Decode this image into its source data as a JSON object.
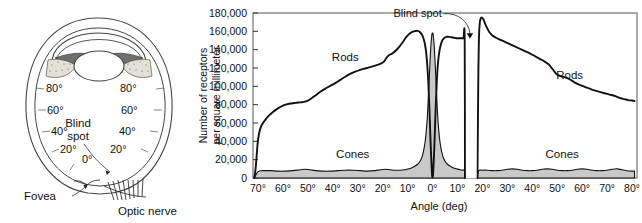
{
  "figure": {
    "left_panel": {
      "name": "eye-cross-section-diagram",
      "labels": {
        "blind_spot_line1": "Blind",
        "blind_spot_line2": "spot",
        "fovea": "Fovea",
        "optic_nerve": "Optic nerve"
      },
      "angle_ticks_left": [
        "80°",
        "60°",
        "40°",
        "20°"
      ],
      "angle_ticks_right": [
        "80°",
        "60°",
        "40°",
        "20°"
      ],
      "center_tick": "0°",
      "near_blindspot_tick": "20°"
    }
  },
  "chart_data": {
    "type": "line",
    "title": "",
    "xlabel": "Angle (deg)",
    "ylabel": "Number of receptors per square millimeter",
    "ylabel_line1": "Number of receptors",
    "ylabel_line2": "per square millimeter",
    "ylim": [
      0,
      180000
    ],
    "ytick_labels": [
      "0",
      "20,000",
      "40,000",
      "60,000",
      "80,000",
      "100,000",
      "120,000",
      "140,000",
      "160,000",
      "180,000"
    ],
    "ytick_values": [
      0,
      20000,
      40000,
      60000,
      80000,
      100000,
      120000,
      140000,
      160000,
      180000
    ],
    "xtick_labels": [
      "70°",
      "60°",
      "50°",
      "40°",
      "30°",
      "20°",
      "10°",
      "0°",
      "10°",
      "20°",
      "30°",
      "40°",
      "50°",
      "60°",
      "70°",
      "80°"
    ],
    "xtick_values": [
      -70,
      -60,
      -50,
      -40,
      -30,
      -20,
      -10,
      0,
      10,
      20,
      30,
      40,
      50,
      60,
      70,
      80
    ],
    "xlim": [
      -72,
      82
    ],
    "grid": false,
    "legend_position": "inline-annotations",
    "annotations": [
      {
        "text": "Blind spot",
        "target_x": 15,
        "target_y": 152000
      },
      {
        "text": "Rods",
        "x": -35,
        "y": 128000
      },
      {
        "text": "Rods",
        "x": 55,
        "y": 108000
      },
      {
        "text": "Cones",
        "x": -32,
        "y": 22000
      },
      {
        "text": "Cones",
        "x": 52,
        "y": 22000
      }
    ],
    "blind_spot_gap": {
      "from_deg": 13.0,
      "to_deg": 18.0,
      "label": "Blind spot"
    },
    "series": [
      {
        "name": "Rods",
        "fill": "none",
        "stroke": "#111111",
        "points": [
          [
            -71.5,
            0
          ],
          [
            -71.0,
            9000
          ],
          [
            -70.6,
            22000
          ],
          [
            -70.2,
            36000
          ],
          [
            -69.6,
            48000
          ],
          [
            -68.8,
            56000
          ],
          [
            -67.5,
            62000
          ],
          [
            -66.0,
            67000
          ],
          [
            -64.0,
            72000
          ],
          [
            -62.0,
            76000
          ],
          [
            -60.0,
            79000
          ],
          [
            -57.5,
            81000
          ],
          [
            -55.0,
            82000
          ],
          [
            -53.0,
            82500
          ],
          [
            -51.5,
            83000
          ],
          [
            -50.0,
            84500
          ],
          [
            -48.5,
            87000
          ],
          [
            -47.0,
            90000
          ],
          [
            -45.0,
            94000
          ],
          [
            -43.0,
            97500
          ],
          [
            -41.0,
            100500
          ],
          [
            -39.0,
            103500
          ],
          [
            -37.0,
            107000
          ],
          [
            -35.0,
            110500
          ],
          [
            -33.0,
            113500
          ],
          [
            -31.0,
            116000
          ],
          [
            -29.0,
            118000
          ],
          [
            -27.0,
            119500
          ],
          [
            -25.0,
            121000
          ],
          [
            -23.0,
            122500
          ],
          [
            -21.0,
            124500
          ],
          [
            -19.5,
            127000
          ],
          [
            -18.5,
            131000
          ],
          [
            -17.5,
            134000
          ],
          [
            -16.0,
            136000
          ],
          [
            -14.0,
            141000
          ],
          [
            -12.0,
            148000
          ],
          [
            -10.5,
            154000
          ],
          [
            -9.0,
            158000
          ],
          [
            -7.5,
            160000
          ],
          [
            -6.0,
            160500
          ],
          [
            -5.0,
            159000
          ],
          [
            -4.0,
            155000
          ],
          [
            -3.2,
            148000
          ],
          [
            -2.6,
            138000
          ],
          [
            -2.2,
            126000
          ],
          [
            -1.8,
            110000
          ],
          [
            -1.5,
            92000
          ],
          [
            -1.2,
            72000
          ],
          [
            -1.0,
            56000
          ],
          [
            -0.8,
            40000
          ],
          [
            -0.6,
            26000
          ],
          [
            -0.4,
            14000
          ],
          [
            -0.25,
            6000
          ],
          [
            -0.15,
            2000
          ],
          [
            0.0,
            0
          ],
          [
            0.15,
            2000
          ],
          [
            0.25,
            6000
          ],
          [
            0.4,
            14000
          ],
          [
            0.6,
            26000
          ],
          [
            0.8,
            40000
          ],
          [
            1.0,
            56000
          ],
          [
            1.2,
            72000
          ],
          [
            1.5,
            92000
          ],
          [
            1.8,
            110000
          ],
          [
            2.2,
            126000
          ],
          [
            2.8,
            139000
          ],
          [
            3.6,
            148000
          ],
          [
            4.6,
            152500
          ],
          [
            5.6,
            154000
          ],
          [
            6.6,
            154000
          ],
          [
            7.6,
            153500
          ],
          [
            8.6,
            153000
          ],
          [
            9.6,
            152500
          ],
          [
            10.6,
            152500
          ],
          [
            11.6,
            152500
          ],
          [
            12.4,
            152500
          ],
          [
            12.9,
            152000
          ],
          [
            13.0,
            0
          ]
        ]
      },
      {
        "name": "Rods-right",
        "fill": "none",
        "stroke": "#111111",
        "points": [
          [
            18.0,
            0
          ],
          [
            18.2,
            60000
          ],
          [
            18.4,
            120000
          ],
          [
            18.6,
            152000
          ],
          [
            18.9,
            168000
          ],
          [
            19.3,
            174000
          ],
          [
            19.8,
            175000
          ],
          [
            20.4,
            173000
          ],
          [
            21.0,
            169000
          ],
          [
            21.8,
            164000
          ],
          [
            22.8,
            159000
          ],
          [
            24.0,
            155500
          ],
          [
            25.5,
            153000
          ],
          [
            27.0,
            151000
          ],
          [
            29.0,
            148500
          ],
          [
            31.0,
            146000
          ],
          [
            33.0,
            143500
          ],
          [
            35.0,
            141000
          ],
          [
            37.0,
            138500
          ],
          [
            39.0,
            136000
          ],
          [
            41.0,
            133000
          ],
          [
            43.0,
            130000
          ],
          [
            45.0,
            127000
          ],
          [
            46.5,
            124000
          ],
          [
            47.5,
            121000
          ],
          [
            48.5,
            117500
          ],
          [
            49.5,
            114000
          ],
          [
            50.5,
            112000
          ],
          [
            51.5,
            111000
          ],
          [
            53.0,
            110000
          ],
          [
            54.5,
            108500
          ],
          [
            56.0,
            106000
          ],
          [
            57.5,
            103500
          ],
          [
            59.0,
            101500
          ],
          [
            61.0,
            99500
          ],
          [
            63.0,
            97500
          ],
          [
            65.0,
            95500
          ],
          [
            67.0,
            94000
          ],
          [
            69.0,
            92500
          ],
          [
            71.0,
            91000
          ],
          [
            72.5,
            90000
          ],
          [
            74.0,
            88500
          ],
          [
            75.5,
            87000
          ],
          [
            77.0,
            86000
          ],
          [
            78.5,
            85000
          ],
          [
            80.0,
            84500
          ],
          [
            81.0,
            84000
          ]
        ]
      },
      {
        "name": "Cones",
        "fill": "#c9c9c9",
        "stroke": "#111111",
        "points": [
          [
            -71.5,
            0
          ],
          [
            -70.0,
            7000
          ],
          [
            -68.0,
            8000
          ],
          [
            -65.0,
            8000
          ],
          [
            -62.0,
            7500
          ],
          [
            -59.0,
            7500
          ],
          [
            -56.0,
            8000
          ],
          [
            -53.0,
            9000
          ],
          [
            -51.0,
            9500
          ],
          [
            -49.0,
            9000
          ],
          [
            -47.0,
            8000
          ],
          [
            -44.0,
            7500
          ],
          [
            -41.0,
            7500
          ],
          [
            -38.0,
            8000
          ],
          [
            -35.0,
            8500
          ],
          [
            -32.0,
            8500
          ],
          [
            -29.0,
            8000
          ],
          [
            -26.0,
            7500
          ],
          [
            -23.0,
            8000
          ],
          [
            -21.0,
            9000
          ],
          [
            -19.0,
            9500
          ],
          [
            -17.0,
            9000
          ],
          [
            -15.0,
            8500
          ],
          [
            -13.0,
            8500
          ],
          [
            -11.0,
            9000
          ],
          [
            -9.5,
            10000
          ],
          [
            -8.0,
            11500
          ],
          [
            -7.0,
            13000
          ],
          [
            -6.0,
            15000
          ],
          [
            -5.2,
            17500
          ],
          [
            -4.5,
            21000
          ],
          [
            -4.0,
            25000
          ],
          [
            -3.5,
            31000
          ],
          [
            -3.0,
            39000
          ],
          [
            -2.6,
            49000
          ],
          [
            -2.2,
            62000
          ],
          [
            -1.9,
            76000
          ],
          [
            -1.6,
            92000
          ],
          [
            -1.3,
            110000
          ],
          [
            -1.0,
            128000
          ],
          [
            -0.7,
            143000
          ],
          [
            -0.4,
            153000
          ],
          [
            -0.2,
            157500
          ],
          [
            0.0,
            158000
          ],
          [
            0.2,
            157500
          ],
          [
            0.4,
            153000
          ],
          [
            0.7,
            143000
          ],
          [
            1.0,
            128000
          ],
          [
            1.3,
            110000
          ],
          [
            1.6,
            92000
          ],
          [
            1.9,
            76000
          ],
          [
            2.2,
            62000
          ],
          [
            2.6,
            49000
          ],
          [
            3.0,
            39000
          ],
          [
            3.5,
            31000
          ],
          [
            4.0,
            25000
          ],
          [
            4.5,
            21000
          ],
          [
            5.2,
            17500
          ],
          [
            6.0,
            15000
          ],
          [
            7.0,
            13000
          ],
          [
            8.0,
            11500
          ],
          [
            9.5,
            10000
          ],
          [
            11.0,
            9000
          ],
          [
            12.0,
            8500
          ],
          [
            12.9,
            8500
          ],
          [
            13.0,
            0
          ]
        ]
      },
      {
        "name": "Cones-right",
        "fill": "#c9c9c9",
        "stroke": "#111111",
        "points": [
          [
            18.0,
            0
          ],
          [
            18.5,
            8000
          ],
          [
            20.0,
            8500
          ],
          [
            22.0,
            8500
          ],
          [
            24.0,
            8000
          ],
          [
            26.0,
            8000
          ],
          [
            28.0,
            8500
          ],
          [
            30.0,
            9500
          ],
          [
            32.0,
            10000
          ],
          [
            34.0,
            9500
          ],
          [
            36.0,
            8500
          ],
          [
            38.0,
            8000
          ],
          [
            40.0,
            8000
          ],
          [
            42.0,
            8500
          ],
          [
            44.0,
            9500
          ],
          [
            46.0,
            10000
          ],
          [
            48.0,
            9500
          ],
          [
            50.0,
            8500
          ],
          [
            52.0,
            8000
          ],
          [
            54.0,
            8000
          ],
          [
            56.0,
            8500
          ],
          [
            58.0,
            9500
          ],
          [
            60.0,
            10000
          ],
          [
            62.0,
            9500
          ],
          [
            64.0,
            8500
          ],
          [
            66.0,
            8000
          ],
          [
            68.0,
            8000
          ],
          [
            70.0,
            8500
          ],
          [
            72.0,
            9500
          ],
          [
            74.0,
            10000
          ],
          [
            76.0,
            9000
          ],
          [
            78.0,
            8000
          ],
          [
            80.0,
            7500
          ],
          [
            81.0,
            7500
          ]
        ]
      }
    ]
  }
}
